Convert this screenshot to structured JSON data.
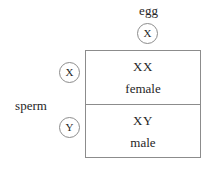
{
  "diagram": {
    "axes": {
      "top_label": "egg",
      "left_label": "sperm"
    },
    "gametes": {
      "egg": [
        {
          "symbol": "X",
          "name": "egg-gamete-x"
        }
      ],
      "sperm": [
        {
          "symbol": "X",
          "name": "sperm-gamete-x"
        },
        {
          "symbol": "Y",
          "name": "sperm-gamete-y"
        }
      ]
    },
    "cells": [
      {
        "genotype": "XX",
        "phenotype": "female"
      },
      {
        "genotype": "XY",
        "phenotype": "male"
      }
    ],
    "colors": {
      "line": "#8c8c8c",
      "text": "#262626",
      "background": "#ffffff"
    }
  }
}
